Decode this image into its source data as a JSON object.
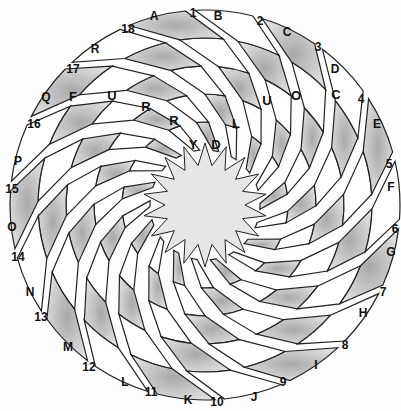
{
  "puzzle": {
    "type": "swirl-word-puzzle",
    "arms": 18,
    "center": [
      205,
      205
    ],
    "colors": {
      "line": "#222222",
      "shaded_light": "#d8d8d8",
      "shaded_dark": "#9a9a9a",
      "white": "#ffffff",
      "center": "#e6e6e6"
    },
    "letter_labels": [
      "A",
      "B",
      "C",
      "D",
      "E",
      "F",
      "G",
      "H",
      "I",
      "J",
      "K",
      "L",
      "M",
      "N",
      "O",
      "P",
      "Q",
      "R"
    ],
    "number_labels": [
      "1",
      "2",
      "3",
      "4",
      "5",
      "6",
      "7",
      "8",
      "9",
      "10",
      "11",
      "12",
      "13",
      "14",
      "15",
      "16",
      "17",
      "18"
    ],
    "label_positions": {
      "letters": [
        [
          154,
          17
        ],
        [
          218,
          17
        ],
        [
          287,
          33
        ],
        [
          335,
          70
        ],
        [
          377,
          125
        ],
        [
          391,
          188
        ],
        [
          391,
          253
        ],
        [
          363,
          314
        ],
        [
          316,
          366
        ],
        [
          254,
          398
        ],
        [
          188,
          401
        ],
        [
          125,
          383
        ],
        [
          68,
          348
        ],
        [
          30,
          293
        ],
        [
          12,
          228
        ],
        [
          18,
          162
        ],
        [
          46,
          98
        ],
        [
          95,
          50
        ]
      ],
      "numbers": [
        [
          193,
          14
        ],
        [
          260,
          22
        ],
        [
          318,
          48
        ],
        [
          361,
          100
        ],
        [
          389,
          165
        ],
        [
          395,
          230
        ],
        [
          383,
          293
        ],
        [
          345,
          346
        ],
        [
          283,
          383
        ],
        [
          217,
          403
        ],
        [
          151,
          393
        ],
        [
          89,
          368
        ],
        [
          41,
          318
        ],
        [
          18,
          258
        ],
        [
          12,
          190
        ],
        [
          34,
          125
        ],
        [
          73,
          70
        ],
        [
          128,
          30
        ]
      ]
    },
    "filled_entries": [
      {
        "label": "Q",
        "cells": [
          {
            "ch": "F",
            "x": 73,
            "y": 98
          },
          {
            "ch": "U",
            "x": 112,
            "y": 97
          },
          {
            "ch": "R",
            "x": 146,
            "y": 108
          },
          {
            "ch": "R",
            "x": 174,
            "y": 122
          },
          {
            "ch": "Y",
            "x": 193,
            "y": 146
          }
        ]
      },
      {
        "label": "D",
        "cells": [
          {
            "ch": "C",
            "x": 336,
            "y": 96
          },
          {
            "ch": "O",
            "x": 296,
            "y": 97
          },
          {
            "ch": "U",
            "x": 267,
            "y": 102
          },
          {
            "ch": "L",
            "x": 236,
            "y": 125
          },
          {
            "ch": "D",
            "x": 216,
            "y": 146
          }
        ]
      }
    ]
  }
}
